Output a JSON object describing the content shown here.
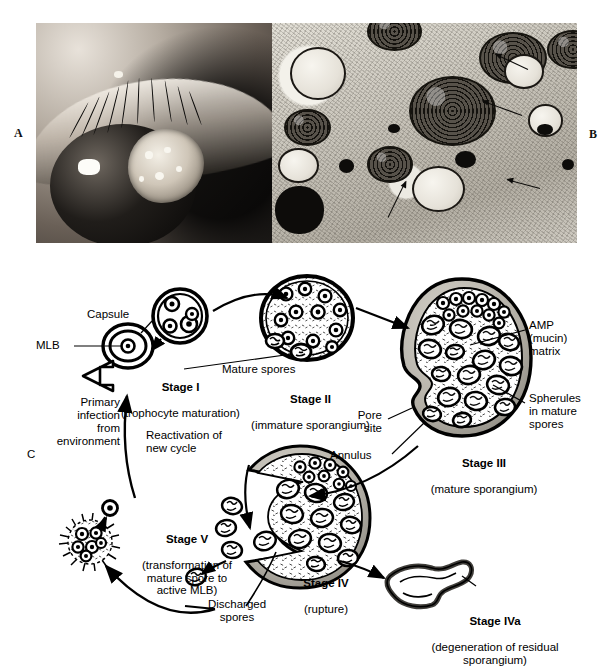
{
  "figure": {
    "panels": [
      {
        "letter": "A",
        "kind": "clinical-photograph",
        "subject": "eye with conjunctival lesion"
      },
      {
        "letter": "B",
        "kind": "electron-micrograph",
        "subject": "sporangium with endospores"
      },
      {
        "letter": "C",
        "kind": "life-cycle-diagram",
        "subject": "Rhinosporidium seeberi life cycle"
      }
    ]
  },
  "diagram": {
    "labels": {
      "capsule": "Capsule",
      "mlb": "MLB",
      "mature_spores": "Mature spores",
      "amp_matrix": "AMP\n(mucin)\nmatrix",
      "spherules": "Spherules\nin mature\nspores",
      "pore_site": "Pore\nsite",
      "annulus": "Annulus",
      "primary_infection": "Primary\ninfection\nfrom\nenvironment",
      "reactivation": "Reactivation of\nnew cycle",
      "discharged_spores": "Discharged\nspores"
    },
    "stages": [
      {
        "id": "stage-1",
        "title": "Stage I",
        "caption": "(trophocyte maturation)"
      },
      {
        "id": "stage-2",
        "title": "Stage II",
        "caption": "(immature sporangium)"
      },
      {
        "id": "stage-3",
        "title": "Stage III",
        "caption": "(mature sporangium)"
      },
      {
        "id": "stage-4",
        "title": "Stage IV",
        "caption": "(rupture)"
      },
      {
        "id": "stage-4a",
        "title": "Stage IVa",
        "caption": "(degeneration of residual\nsporangium)"
      },
      {
        "id": "stage-5",
        "title": "Stage V",
        "caption": "(transformation of\nmature spore to\nactive MLB)"
      }
    ]
  },
  "colors": {
    "ink": "#000000",
    "wall_gray": "#b9b6ae",
    "wall_gray_dark": "#8d8a82",
    "spore_fill": "#efeee9",
    "paper": "#ffffff"
  }
}
